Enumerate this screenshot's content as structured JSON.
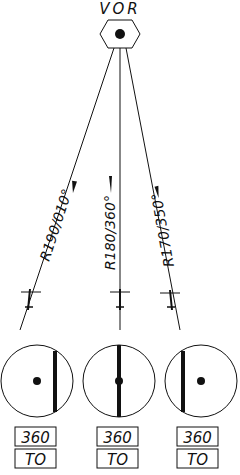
{
  "station": {
    "label": "VOR"
  },
  "radials": [
    {
      "label": "R190/010°",
      "obs": "360",
      "flag": "TO",
      "cdi": "right"
    },
    {
      "label": "R180/360°",
      "obs": "360",
      "flag": "TO",
      "cdi": "center"
    },
    {
      "label": "R170/350°",
      "obs": "360",
      "flag": "TO",
      "cdi": "left"
    }
  ],
  "colors": {
    "ink": "#111111",
    "background": "#ffffff"
  }
}
